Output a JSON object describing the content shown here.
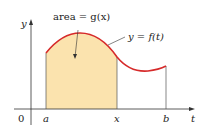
{
  "diagram": {
    "area_label": "area = g(x)",
    "curve_label": "y = f(t)",
    "y_axis_label": "y",
    "x_axis_label": "t",
    "origin_label": "0",
    "tick_a": "a",
    "tick_x": "x",
    "tick_b": "b",
    "colors": {
      "curve": "#d62a2a",
      "fill": "#fbe3ae",
      "axis": "#333333"
    }
  }
}
